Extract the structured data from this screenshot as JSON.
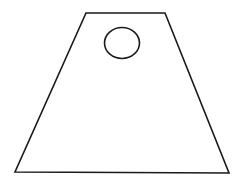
{
  "diagram": {
    "type": "geometric-shape",
    "stroke_color": "#1a1a1a",
    "background": "#ffffff",
    "trapezoid": {
      "points": [
        [
          86,
          13
        ],
        [
          165,
          13
        ],
        [
          229,
          173
        ],
        [
          15,
          172
        ]
      ]
    },
    "circle": {
      "cx": 122,
      "cy": 43,
      "rx": 17.5,
      "ry": 15.5
    }
  }
}
